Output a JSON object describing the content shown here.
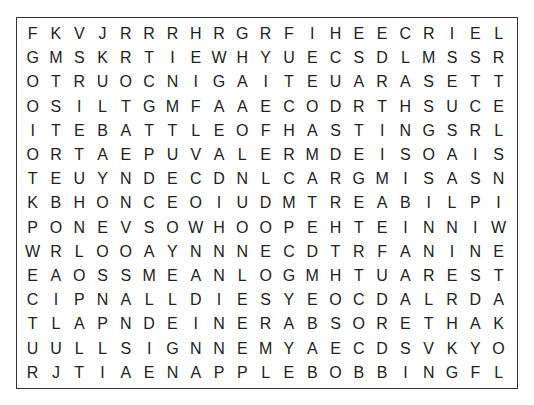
{
  "puzzle": {
    "type": "word-search",
    "rows": 15,
    "cols": 21,
    "colors": {
      "text": "#222222",
      "border": "#333333",
      "background": "#ffffff"
    },
    "grid": [
      [
        "F",
        "K",
        "V",
        "J",
        "R",
        "R",
        "R",
        "H",
        "R",
        "G",
        "R",
        "F",
        "I",
        "H",
        "E",
        "E",
        "C",
        "R",
        "I",
        "E",
        "L"
      ],
      [
        "G",
        "M",
        "S",
        "K",
        "R",
        "T",
        "I",
        "E",
        "W",
        "H",
        "Y",
        "U",
        "E",
        "C",
        "S",
        "D",
        "L",
        "M",
        "S",
        "S",
        "R"
      ],
      [
        "O",
        "T",
        "R",
        "U",
        "O",
        "C",
        "N",
        "I",
        "G",
        "A",
        "I",
        "T",
        "E",
        "U",
        "A",
        "R",
        "A",
        "S",
        "E",
        "T",
        "T"
      ],
      [
        "O",
        "S",
        "I",
        "L",
        "T",
        "G",
        "M",
        "F",
        "A",
        "A",
        "E",
        "C",
        "O",
        "D",
        "R",
        "T",
        "H",
        "S",
        "U",
        "C",
        "E"
      ],
      [
        "I",
        "T",
        "E",
        "B",
        "A",
        "T",
        "T",
        "L",
        "E",
        "O",
        "F",
        "H",
        "A",
        "S",
        "T",
        "I",
        "N",
        "G",
        "S",
        "R",
        "L"
      ],
      [
        "O",
        "R",
        "T",
        "A",
        "E",
        "P",
        "U",
        "V",
        "A",
        "L",
        "E",
        "R",
        "M",
        "D",
        "E",
        "I",
        "S",
        "O",
        "A",
        "I",
        "S"
      ],
      [
        "T",
        "E",
        "U",
        "Y",
        "N",
        "D",
        "E",
        "C",
        "D",
        "N",
        "L",
        "C",
        "A",
        "R",
        "G",
        "M",
        "I",
        "S",
        "A",
        "S",
        "N"
      ],
      [
        "K",
        "B",
        "H",
        "O",
        "N",
        "C",
        "E",
        "O",
        "I",
        "U",
        "D",
        "M",
        "T",
        "R",
        "E",
        "A",
        "B",
        "I",
        "L",
        "P",
        "I"
      ],
      [
        "P",
        "O",
        "N",
        "E",
        "V",
        "S",
        "O",
        "W",
        "H",
        "O",
        "O",
        "P",
        "E",
        "H",
        "T",
        "E",
        "I",
        "N",
        "N",
        "I",
        "W"
      ],
      [
        "W",
        "R",
        "L",
        "O",
        "O",
        "A",
        "Y",
        "N",
        "N",
        "N",
        "E",
        "C",
        "D",
        "T",
        "R",
        "F",
        "A",
        "N",
        "I",
        "N",
        "E"
      ],
      [
        "E",
        "A",
        "O",
        "S",
        "S",
        "M",
        "E",
        "A",
        "N",
        "L",
        "O",
        "G",
        "M",
        "H",
        "T",
        "U",
        "A",
        "R",
        "E",
        "S",
        "T"
      ],
      [
        "C",
        "I",
        "P",
        "N",
        "A",
        "L",
        "L",
        "D",
        "I",
        "E",
        "S",
        "Y",
        "E",
        "O",
        "C",
        "D",
        "A",
        "L",
        "R",
        "D",
        "A"
      ],
      [
        "T",
        "L",
        "A",
        "P",
        "N",
        "D",
        "E",
        "I",
        "N",
        "E",
        "R",
        "A",
        "B",
        "S",
        "O",
        "R",
        "E",
        "T",
        "H",
        "A",
        "K"
      ],
      [
        "U",
        "U",
        "L",
        "L",
        "S",
        "I",
        "G",
        "N",
        "N",
        "E",
        "M",
        "Y",
        "A",
        "E",
        "C",
        "D",
        "S",
        "V",
        "K",
        "Y",
        "O"
      ],
      [
        "R",
        "J",
        "T",
        "I",
        "A",
        "E",
        "N",
        "A",
        "P",
        "P",
        "L",
        "E",
        "B",
        "O",
        "B",
        "B",
        "I",
        "N",
        "G",
        "F",
        "L"
      ]
    ]
  }
}
